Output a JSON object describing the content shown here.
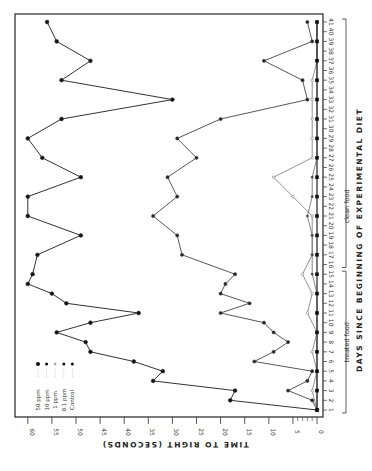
{
  "chart_data": {
    "type": "line",
    "orientation": "rotated-90-ccw",
    "title": "",
    "xlabel": "DAYS SINCE BEGINNING OF EXPERIMENTAL DIET",
    "ylabel": "TIME TO RIGHT (SECONDS)",
    "xlim": [
      1,
      41
    ],
    "ylim": [
      0,
      60
    ],
    "y_ticks": [
      0,
      5,
      10,
      15,
      20,
      25,
      30,
      35,
      40,
      45,
      50,
      55,
      60
    ],
    "x_ticks": [
      1,
      2,
      3,
      4,
      5,
      6,
      7,
      8,
      9,
      10,
      11,
      12,
      13,
      14,
      15,
      16,
      17,
      18,
      19,
      20,
      21,
      22,
      23,
      24,
      25,
      26,
      27,
      28,
      29,
      30,
      31,
      32,
      33,
      34,
      35,
      36,
      37,
      38,
      39,
      40,
      41
    ],
    "grid": false,
    "legend_position": "upper-left (rotated)",
    "annotations": [
      {
        "text": "treated food",
        "days": [
          1,
          15
        ]
      },
      {
        "text": "clean food",
        "days": [
          16,
          41
        ]
      }
    ],
    "series": [
      {
        "name": "50 ppm",
        "marker": "large-dot",
        "points": [
          [
            1,
            0
          ],
          [
            2,
            18
          ],
          [
            3,
            17
          ],
          [
            4,
            34
          ],
          [
            5,
            32
          ],
          [
            6,
            38
          ],
          [
            7,
            47
          ],
          [
            8,
            48
          ],
          [
            9,
            54
          ],
          [
            10,
            47
          ],
          [
            11,
            37
          ],
          [
            12,
            52
          ],
          [
            13,
            55
          ],
          [
            14,
            60
          ],
          [
            15,
            59
          ],
          [
            17,
            58
          ],
          [
            19,
            49
          ],
          [
            21,
            60
          ],
          [
            23,
            60
          ],
          [
            25,
            49
          ],
          [
            27,
            57
          ],
          [
            29,
            60
          ],
          [
            31,
            53
          ],
          [
            33,
            30
          ],
          [
            35,
            53
          ],
          [
            37,
            47
          ],
          [
            39,
            54
          ],
          [
            41,
            56
          ]
        ]
      },
      {
        "name": "10 ppm",
        "marker": "dot",
        "points": [
          [
            1,
            0
          ],
          [
            2,
            1
          ],
          [
            3,
            6
          ],
          [
            4,
            2
          ],
          [
            5,
            1
          ],
          [
            6,
            13
          ],
          [
            7,
            9
          ],
          [
            8,
            6
          ],
          [
            9,
            9
          ],
          [
            10,
            11
          ],
          [
            11,
            20
          ],
          [
            12,
            14
          ],
          [
            13,
            20
          ],
          [
            14,
            19
          ],
          [
            15,
            17
          ],
          [
            17,
            28
          ],
          [
            19,
            29
          ],
          [
            21,
            34
          ],
          [
            23,
            29
          ],
          [
            25,
            31
          ],
          [
            27,
            25
          ],
          [
            29,
            29
          ],
          [
            31,
            20
          ],
          [
            33,
            2
          ],
          [
            35,
            3
          ],
          [
            37,
            11
          ],
          [
            39,
            1
          ],
          [
            41,
            2
          ]
        ]
      },
      {
        "name": "1 ppm",
        "marker": "small-open-dot",
        "points": [
          [
            1,
            0
          ],
          [
            3,
            1
          ],
          [
            5,
            0
          ],
          [
            7,
            1
          ],
          [
            9,
            0
          ],
          [
            11,
            2
          ],
          [
            13,
            1
          ],
          [
            15,
            3
          ],
          [
            17,
            1
          ],
          [
            19,
            1
          ],
          [
            21,
            1
          ],
          [
            23,
            5
          ],
          [
            25,
            9
          ],
          [
            27,
            1
          ],
          [
            29,
            1
          ],
          [
            31,
            1
          ],
          [
            33,
            1
          ],
          [
            35,
            1
          ],
          [
            37,
            0
          ],
          [
            39,
            0
          ],
          [
            41,
            0
          ]
        ]
      },
      {
        "name": "0.1 ppm",
        "marker": "small-dot",
        "points": [
          [
            1,
            0
          ],
          [
            3,
            0
          ],
          [
            5,
            0
          ],
          [
            7,
            0
          ],
          [
            9,
            0
          ],
          [
            11,
            0
          ],
          [
            13,
            0
          ],
          [
            15,
            1
          ],
          [
            17,
            1
          ],
          [
            19,
            1
          ],
          [
            21,
            2
          ],
          [
            23,
            1
          ],
          [
            25,
            1
          ],
          [
            27,
            0
          ],
          [
            29,
            0
          ],
          [
            31,
            0
          ],
          [
            33,
            0
          ],
          [
            35,
            0
          ],
          [
            37,
            0
          ],
          [
            39,
            0
          ],
          [
            41,
            0
          ]
        ]
      },
      {
        "name": "Control",
        "marker": "square-dot",
        "points": [
          [
            1,
            0
          ],
          [
            3,
            0
          ],
          [
            5,
            0
          ],
          [
            7,
            0
          ],
          [
            9,
            0
          ],
          [
            11,
            0
          ],
          [
            13,
            0
          ],
          [
            15,
            0
          ],
          [
            17,
            0
          ],
          [
            19,
            0
          ],
          [
            21,
            0
          ],
          [
            23,
            0
          ],
          [
            25,
            0
          ],
          [
            27,
            0
          ],
          [
            29,
            0
          ],
          [
            31,
            0
          ],
          [
            33,
            0
          ],
          [
            35,
            0
          ],
          [
            37,
            0
          ],
          [
            39,
            0
          ],
          [
            41,
            0
          ]
        ]
      }
    ]
  },
  "legend": {
    "items": [
      {
        "label": "50 ppm"
      },
      {
        "label": "10 ppm"
      },
      {
        "label": "1 ppm"
      },
      {
        "label": "0.1 ppm"
      },
      {
        "label": "Control"
      }
    ]
  },
  "axes": {
    "x_title": "DAYS SINCE BEGINNING OF EXPERIMENTAL DIET",
    "y_title": "TIME TO RIGHT (SECONDS)",
    "treated_label": "treated food",
    "clean_label": "clean food"
  }
}
